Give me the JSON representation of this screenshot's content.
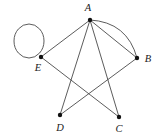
{
  "figure": {
    "width": 164,
    "height": 137,
    "background_color": "#ffffff",
    "edge_color": "#4a4a4a",
    "node_color": "#111111",
    "label_color": "#1a1a1a"
  },
  "graph": {
    "nodes": [
      {
        "id": "A",
        "label": "A",
        "x": 90,
        "y": 20,
        "label_x": 88,
        "label_y": 9
      },
      {
        "id": "B",
        "label": "B",
        "x": 137,
        "y": 58,
        "label_x": 148,
        "label_y": 60
      },
      {
        "id": "C",
        "label": "C",
        "x": 119,
        "y": 117,
        "label_x": 119,
        "label_y": 130
      },
      {
        "id": "D",
        "label": "D",
        "x": 60,
        "y": 115,
        "label_x": 60,
        "label_y": 129
      },
      {
        "id": "E",
        "label": "E",
        "x": 41,
        "y": 57,
        "label_x": 38,
        "label_y": 69
      }
    ],
    "edges": [
      {
        "from": "A",
        "to": "E",
        "style": "straight"
      },
      {
        "from": "A",
        "to": "B",
        "style": "straight"
      },
      {
        "from": "A",
        "to": "B",
        "style": "curved",
        "bulge": 22
      },
      {
        "from": "A",
        "to": "C",
        "style": "straight"
      },
      {
        "from": "A",
        "to": "D",
        "style": "straight"
      },
      {
        "from": "B",
        "to": "D",
        "style": "straight"
      },
      {
        "from": "E",
        "to": "C",
        "style": "straight"
      }
    ],
    "loops": [
      {
        "at": "E",
        "center_x": 29,
        "center_y": 41,
        "radius_x": 15,
        "radius_y": 17
      }
    ]
  }
}
